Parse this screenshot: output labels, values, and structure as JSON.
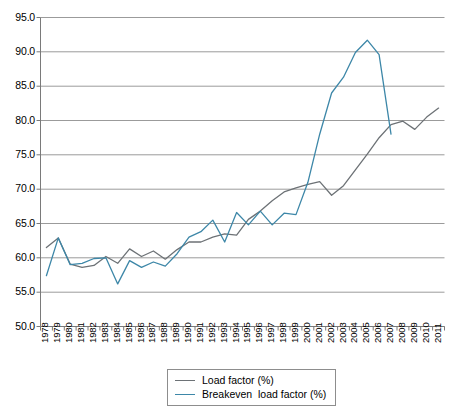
{
  "chart_data": {
    "type": "line",
    "title": "",
    "subtitle": "",
    "xlabel": "",
    "ylabel": "",
    "ylim": [
      50.0,
      95.0
    ],
    "ytick_step": 5.0,
    "yticks": [
      "50.0",
      "55.0",
      "60.0",
      "65.0",
      "70.0",
      "75.0",
      "80.0",
      "85.0",
      "90.0",
      "95.0"
    ],
    "grid": "horizontal",
    "legend_position": "bottom-center",
    "categories": [
      "1978",
      "1979",
      "1980",
      "1981",
      "1982",
      "1983",
      "1984",
      "1985",
      "1986",
      "1987",
      "1988",
      "1989",
      "1990",
      "1991",
      "1992",
      "1993",
      "1994",
      "1995",
      "1996",
      "1997",
      "1998",
      "1999",
      "2000",
      "2001",
      "2002",
      "2003",
      "2004",
      "2005",
      "2006",
      "2007",
      "2008",
      "2009",
      "2010",
      "2011"
    ],
    "series": [
      {
        "name": "Load factor (%)",
        "color": "#6d7276",
        "values": [
          61.5,
          62.9,
          59.1,
          58.6,
          58.9,
          60.2,
          59.2,
          61.3,
          60.2,
          61.0,
          59.8,
          61.2,
          62.3,
          62.3,
          63.0,
          63.5,
          63.3,
          65.6,
          66.8,
          68.3,
          69.6,
          70.2,
          70.7,
          71.1,
          69.1,
          70.5,
          72.8,
          75.1,
          77.5,
          79.4,
          79.9,
          78.7,
          80.5,
          81.8
        ]
      },
      {
        "name": "Breakeven  load factor (%)",
        "color": "#3d87a8",
        "values": [
          57.4,
          62.9,
          59.0,
          59.2,
          59.9,
          60.0,
          56.2,
          59.6,
          58.6,
          59.4,
          58.8,
          60.6,
          63.0,
          63.8,
          65.5,
          62.3,
          66.6,
          64.8,
          66.8,
          64.8,
          66.5,
          66.3,
          71.0,
          78.0,
          84.0,
          86.3,
          89.9,
          91.7,
          89.6,
          78.0,
          null,
          null,
          null,
          null
        ]
      }
    ]
  },
  "legend": {
    "items": [
      {
        "label": "Load factor (%)",
        "color": "#6d7276"
      },
      {
        "label": "Breakeven  load factor (%)",
        "color": "#3d87a8"
      }
    ]
  }
}
